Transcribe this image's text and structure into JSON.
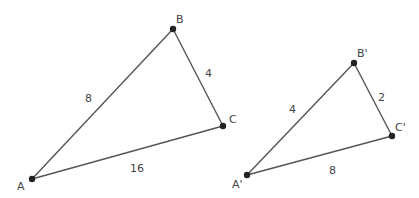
{
  "diagram": {
    "type": "similar-triangles",
    "colors": {
      "line": "#555555",
      "point": "#222222",
      "text": "#444444",
      "background": "#ffffff"
    },
    "triangles": [
      {
        "name": "ABC",
        "vertices": {
          "A": {
            "label": "A",
            "x": 32,
            "y": 179
          },
          "B": {
            "label": "B",
            "x": 173,
            "y": 29
          },
          "C": {
            "label": "C",
            "x": 223,
            "y": 126
          }
        },
        "sides": {
          "AB": "8",
          "BC": "4",
          "AC": "16"
        }
      },
      {
        "name": "A'B'C'",
        "vertices": {
          "A": {
            "label": "A'",
            "x": 247,
            "y": 175
          },
          "B": {
            "label": "B'",
            "x": 354,
            "y": 63
          },
          "C": {
            "label": "C'",
            "x": 392,
            "y": 136
          }
        },
        "sides": {
          "AB": "4",
          "BC": "2",
          "AC": "8"
        }
      }
    ]
  }
}
